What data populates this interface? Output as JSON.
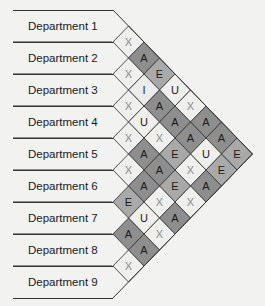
{
  "diagram": {
    "type": "activity-relationship-chart",
    "departments": [
      "Department 1",
      "Department 2",
      "Department 3",
      "Department 4",
      "Department 5",
      "Department 6",
      "Department 7",
      "Department 8",
      "Department 9"
    ],
    "relationships": [
      {
        "a": 1,
        "b": 2,
        "code": "X"
      },
      {
        "a": 1,
        "b": 3,
        "code": "A"
      },
      {
        "a": 1,
        "b": 4,
        "code": "E"
      },
      {
        "a": 1,
        "b": 5,
        "code": "U"
      },
      {
        "a": 1,
        "b": 6,
        "code": "X"
      },
      {
        "a": 1,
        "b": 7,
        "code": "A"
      },
      {
        "a": 1,
        "b": 8,
        "code": "A"
      },
      {
        "a": 1,
        "b": 9,
        "code": "E"
      },
      {
        "a": 2,
        "b": 3,
        "code": "X"
      },
      {
        "a": 2,
        "b": 4,
        "code": "I"
      },
      {
        "a": 2,
        "b": 5,
        "code": "A"
      },
      {
        "a": 2,
        "b": 6,
        "code": "A"
      },
      {
        "a": 2,
        "b": 7,
        "code": "A"
      },
      {
        "a": 2,
        "b": 8,
        "code": "U"
      },
      {
        "a": 2,
        "b": 9,
        "code": "E"
      },
      {
        "a": 3,
        "b": 4,
        "code": "X"
      },
      {
        "a": 3,
        "b": 5,
        "code": "U"
      },
      {
        "a": 3,
        "b": 6,
        "code": "X"
      },
      {
        "a": 3,
        "b": 7,
        "code": "E"
      },
      {
        "a": 3,
        "b": 8,
        "code": "X"
      },
      {
        "a": 3,
        "b": 9,
        "code": "A"
      },
      {
        "a": 4,
        "b": 5,
        "code": "X"
      },
      {
        "a": 4,
        "b": 6,
        "code": "A"
      },
      {
        "a": 4,
        "b": 7,
        "code": "A"
      },
      {
        "a": 4,
        "b": 8,
        "code": "E"
      },
      {
        "a": 4,
        "b": 9,
        "code": "X"
      },
      {
        "a": 5,
        "b": 6,
        "code": "X"
      },
      {
        "a": 5,
        "b": 7,
        "code": "A"
      },
      {
        "a": 5,
        "b": 8,
        "code": "X"
      },
      {
        "a": 5,
        "b": 9,
        "code": "A"
      },
      {
        "a": 6,
        "b": 7,
        "code": "E"
      },
      {
        "a": 6,
        "b": 8,
        "code": "U"
      },
      {
        "a": 6,
        "b": 9,
        "code": "X"
      },
      {
        "a": 7,
        "b": 8,
        "code": "A"
      },
      {
        "a": 7,
        "b": 9,
        "code": "A"
      },
      {
        "a": 8,
        "b": 9,
        "code": "X"
      }
    ],
    "code_colors": {
      "A": "#8e8e8e",
      "E": "#a9a9a9",
      "I": "#ececea",
      "U": "#efefed",
      "X": "#efefed"
    },
    "letter_colors": {
      "A": "#1a1a1a",
      "E": "#1a1a1a",
      "I": "#1a1a1a",
      "U": "#1a1a1a",
      "X": "#8a8a8a"
    }
  }
}
